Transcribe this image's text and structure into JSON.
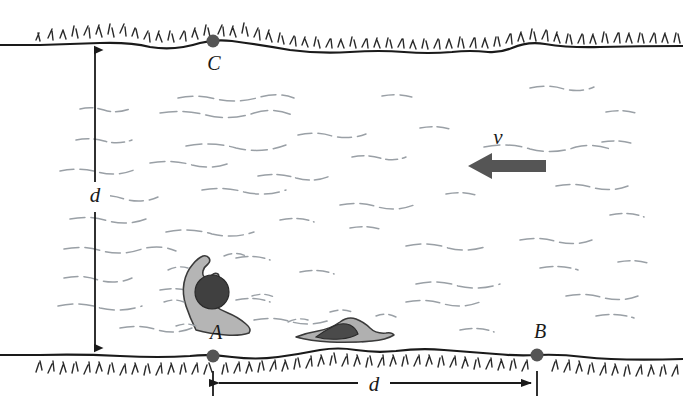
{
  "figure": {
    "background_color": "#ffffff",
    "ink_color": "#1a1a1a",
    "water_line_color": "#9aa0a6",
    "arrow_fill": "#555555",
    "swimmer_body_color": "#b5b5b5",
    "swimmer_head_color": "#404040"
  },
  "labels": {
    "width_vertical": "d",
    "width_horizontal": "d",
    "velocity": "v",
    "point_a": "A",
    "point_b": "B",
    "point_c": "C"
  },
  "geometry": {
    "top_bank_y": 43,
    "bottom_bank_y": 355,
    "point_a_x": 213,
    "point_b_x": 537,
    "point_c_x": 213,
    "vertical_dim_x": 95,
    "horizontal_dim_y": 383,
    "velocity_arrow_from_x": 546,
    "velocity_arrow_to_x": 468,
    "velocity_arrow_y": 166
  },
  "elements": {
    "top_bank_name": "far-bank-shoreline",
    "bottom_bank_name": "near-bank-shoreline",
    "water_name": "river-water-surface",
    "swimmer_a_name": "swimmer-figure-raised-arm",
    "swimmer_b_name": "swimmer-figure-submerged"
  }
}
